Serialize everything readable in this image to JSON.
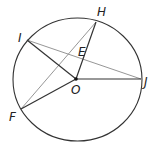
{
  "diagram": {
    "type": "circle-geometry",
    "circle": {
      "center_label": "O",
      "cx": 77.5,
      "cy": 79.5,
      "rx": 64.5,
      "ry": 61.5
    },
    "points": {
      "H": {
        "x": 96,
        "y": 22,
        "label": "H",
        "lx": 97,
        "ly": 16
      },
      "I": {
        "x": 27,
        "y": 40,
        "label": "I",
        "lx": 18,
        "ly": 40
      },
      "J": {
        "x": 141,
        "y": 79,
        "label": "J",
        "lx": 144,
        "ly": 85
      },
      "F": {
        "x": 21,
        "y": 109,
        "label": "F",
        "lx": 9,
        "ly": 120
      },
      "O": {
        "x": 76,
        "y": 79,
        "label": "O",
        "lx": 71,
        "ly": 93
      },
      "E": {
        "label": "E",
        "lx": 78,
        "ly": 56
      }
    },
    "segments": {
      "dark": [
        "IO",
        "OH",
        "OJ",
        "OF",
        "FH"
      ],
      "light": [
        "IJ",
        "FH"
      ]
    },
    "colors": {
      "dark": "#333333",
      "light": "#8a8a8a",
      "circle": "#333333"
    }
  }
}
